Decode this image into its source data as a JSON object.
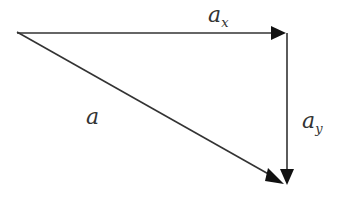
{
  "diagram": {
    "type": "vector-decomposition",
    "vectors": [
      {
        "name": "a",
        "label_main": "a",
        "label_sub": "",
        "from": [
          17,
          32
        ],
        "to": [
          284,
          183
        ],
        "role": "resultant"
      },
      {
        "name": "ax",
        "label_main": "a",
        "label_sub": "x",
        "from": [
          17,
          33
        ],
        "to": [
          286,
          33
        ],
        "role": "x-component"
      },
      {
        "name": "ay",
        "label_main": "a",
        "label_sub": "y",
        "from": [
          287,
          33
        ],
        "to": [
          287,
          184
        ],
        "role": "y-component"
      }
    ],
    "colors": {
      "stroke": "#333333",
      "arrowhead": "#111111",
      "background": "#ffffff"
    }
  }
}
